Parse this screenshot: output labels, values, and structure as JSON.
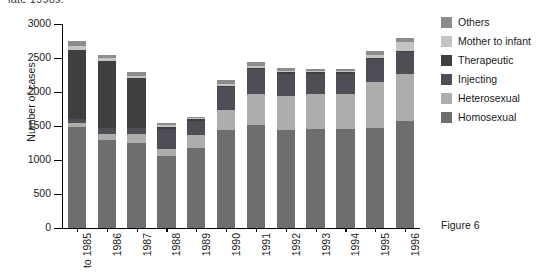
{
  "cutoff_text": "late 1990s.",
  "caption": "Figure 6",
  "legend": {
    "position": "right-top",
    "items": [
      {
        "label": "Others",
        "color": "#8c8c8c"
      },
      {
        "label": "Mother to infant",
        "color": "#c4c4c4"
      },
      {
        "label": "Therapeutic",
        "color": "#3f3f42"
      },
      {
        "label": "Injecting",
        "color": "#4e4e57"
      },
      {
        "label": "Heterosexual",
        "color": "#adadad"
      },
      {
        "label": "Homosexual",
        "color": "#6e6e6e"
      }
    ]
  },
  "chart_data": {
    "type": "bar",
    "subtype": "stacked-vertical",
    "title": "",
    "xlabel": "",
    "ylabel": "Number of cases",
    "ylim": [
      0,
      3000
    ],
    "yticks": [
      0,
      500,
      1000,
      1500,
      2000,
      2500,
      3000
    ],
    "ytick_labels": [
      "0",
      "500",
      "1000",
      "1500",
      "2000",
      "2500",
      "3000"
    ],
    "grid": false,
    "categories": [
      "to 1985",
      "1986",
      "1987",
      "1988",
      "1989",
      "1990",
      "1991",
      "1992",
      "1993",
      "1994",
      "1995",
      "1996"
    ],
    "stack_order_bottom_to_top": [
      "Homosexual",
      "Heterosexual",
      "Injecting",
      "Therapeutic",
      "Mother to infant",
      "Others"
    ],
    "series": [
      {
        "name": "Homosexual",
        "color": "#6e6e6e",
        "values": [
          1490,
          1300,
          1250,
          1060,
          1170,
          1440,
          1510,
          1440,
          1450,
          1450,
          1470,
          1580
        ]
      },
      {
        "name": "Heterosexual",
        "color": "#adadad",
        "values": [
          60,
          90,
          130,
          100,
          200,
          290,
          460,
          500,
          520,
          520,
          680,
          680
        ]
      },
      {
        "name": "Injecting",
        "color": "#4e4e57",
        "values": [
          60,
          80,
          90,
          300,
          210,
          340,
          370,
          330,
          300,
          300,
          330,
          330
        ]
      },
      {
        "name": "Therapeutic",
        "color": "#3f3f42",
        "values": [
          1010,
          980,
          730,
          30,
          20,
          20,
          20,
          20,
          20,
          20,
          20,
          20
        ]
      },
      {
        "name": "Mother to infant",
        "color": "#c4c4c4",
        "values": [
          60,
          50,
          40,
          20,
          15,
          30,
          30,
          25,
          20,
          20,
          40,
          120
        ]
      },
      {
        "name": "Others",
        "color": "#8c8c8c",
        "values": [
          70,
          50,
          50,
          30,
          20,
          50,
          50,
          35,
          30,
          30,
          60,
          60
        ]
      }
    ],
    "totals": [
      2750,
      2550,
      2290,
      1540,
      1635,
      2170,
      2440,
      2350,
      2340,
      2340,
      2600,
      2790
    ]
  }
}
